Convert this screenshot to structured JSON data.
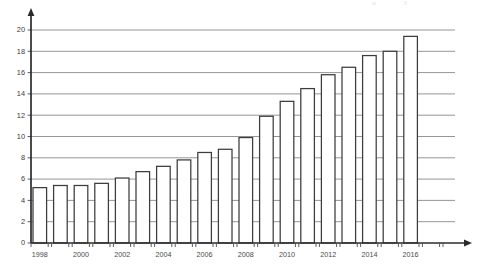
{
  "chart_data": {
    "type": "bar",
    "title": "",
    "subtitle": "",
    "xlabel": "",
    "ylabel": "",
    "categories": [
      "1998",
      "1999",
      "2000",
      "2001",
      "2002",
      "2003",
      "2004",
      "2005",
      "2006",
      "2007",
      "2008",
      "2009",
      "2010",
      "2011",
      "2012",
      "2013",
      "2014",
      "2015",
      "2016",
      "2017"
    ],
    "values": [
      5.2,
      5.4,
      5.4,
      5.6,
      6.1,
      6.7,
      7.2,
      7.8,
      8.5,
      8.8,
      9.9,
      11.9,
      13.3,
      14.5,
      15.8,
      16.5,
      17.6,
      18.0,
      19.4,
      null
    ],
    "bar_count": 20,
    "ylim": [
      0,
      20
    ],
    "ytick_labels": [
      "0",
      "2",
      "4",
      "6",
      "8",
      "10",
      "12",
      "14",
      "16",
      "18",
      "20"
    ],
    "ytick_values": [
      0,
      2,
      4,
      6,
      8,
      10,
      12,
      14,
      16,
      18,
      20
    ],
    "xtick_labels": [
      "1998",
      "2000",
      "2002",
      "2004",
      "2006",
      "2008",
      "2010",
      "2012",
      "2014",
      "2016"
    ],
    "xtick_label_indices": [
      0,
      2,
      4,
      6,
      8,
      10,
      12,
      14,
      16,
      18
    ],
    "grid": true,
    "grid_axis": "y",
    "legend": false,
    "legend_position": "none",
    "bar_fill": "#ffffff",
    "bar_stroke": "#3c3c3c",
    "grid_color": "#8a8a8a",
    "axis_color": "#2b2b2b",
    "axis_style": "arrow-terminated",
    "annotations": []
  },
  "figure": {
    "background": "#ffffff",
    "y_axis_name": "value-axis",
    "x_axis_name": "year-axis"
  }
}
